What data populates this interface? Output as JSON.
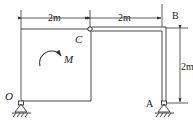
{
  "diagram": {
    "type": "structural-frame",
    "labels": {
      "O": "O",
      "A": "A",
      "B": "B",
      "C": "C",
      "M": "M"
    },
    "dimensions": {
      "top_left": "2m",
      "top_right": "2m",
      "right_vertical": "2m"
    },
    "supports": [
      {
        "name": "O",
        "type": "pin"
      },
      {
        "name": "A",
        "type": "pin"
      }
    ],
    "hinge": "C",
    "moment": {
      "label": "M",
      "direction": "clockwise"
    },
    "colors": {
      "line": "#333333",
      "background": "#ffffff"
    }
  }
}
